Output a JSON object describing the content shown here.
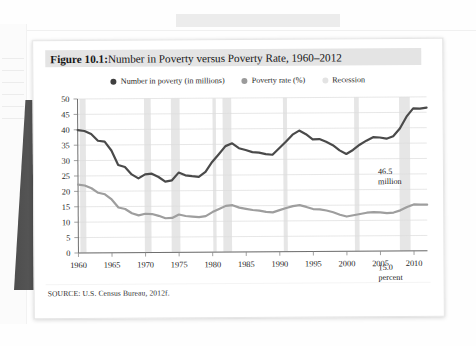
{
  "figure": {
    "label": "Figure 10.1:",
    "title": " Number in Poverty versus Poverty Rate, 1960–2012",
    "source": "SOURCE: U.S. Census Bureau, 2012f."
  },
  "legend": [
    {
      "name": "legend-number-in-poverty",
      "label": "Number in poverty (in millions)",
      "color": "#3f3f3f"
    },
    {
      "name": "legend-poverty-rate",
      "label": "Poverty rate (%)",
      "color": "#9b9b9b"
    },
    {
      "name": "legend-recession",
      "label": "Recession",
      "color": "#e3e3e3"
    }
  ],
  "annotations": [
    {
      "name": "annotation-number",
      "line1": "46.5",
      "line2": "million"
    },
    {
      "name": "annotation-rate",
      "line1": "15.0",
      "line2": "percent"
    }
  ],
  "colors": {
    "number_line": "#4a4a4a",
    "rate_line": "#9e9e9e",
    "recession_band": "#e6e6e6",
    "grid": "#dcdcdc",
    "axis": "#8a8a8a",
    "title_highlight": "#e4e4e4",
    "card": "#ffffff",
    "spine": "#4e4e4e"
  },
  "chart_data": {
    "type": "line",
    "title": "Figure 10.1: Number in Poverty versus Poverty Rate, 1960–2012",
    "xlabel": "",
    "ylabel": "",
    "xlim": [
      1960,
      2012
    ],
    "ylim": [
      0,
      50
    ],
    "ytick_step": 5,
    "yticks": [
      0,
      5,
      10,
      15,
      20,
      25,
      30,
      35,
      40,
      45,
      50
    ],
    "xticks": [
      1960,
      1965,
      1970,
      1975,
      1980,
      1985,
      1990,
      1995,
      2000,
      2005,
      2010
    ],
    "grid": true,
    "legend_position": "top-center",
    "x": [
      1960,
      1961,
      1962,
      1963,
      1964,
      1965,
      1966,
      1967,
      1968,
      1969,
      1970,
      1971,
      1972,
      1973,
      1974,
      1975,
      1976,
      1977,
      1978,
      1979,
      1980,
      1981,
      1982,
      1983,
      1984,
      1985,
      1986,
      1987,
      1988,
      1989,
      1990,
      1991,
      1992,
      1993,
      1994,
      1995,
      1996,
      1997,
      1998,
      1999,
      2000,
      2001,
      2002,
      2003,
      2004,
      2005,
      2006,
      2007,
      2008,
      2009,
      2010,
      2011,
      2012
    ],
    "series": [
      {
        "name": "Number in poverty (in millions)",
        "color": "#4a4a4a",
        "end_label": "46.5 million",
        "values": [
          39.9,
          39.6,
          38.6,
          36.4,
          36.1,
          33.2,
          28.5,
          27.8,
          25.4,
          24.1,
          25.4,
          25.6,
          24.5,
          23.0,
          23.4,
          25.9,
          25.0,
          24.7,
          24.5,
          26.1,
          29.3,
          31.8,
          34.4,
          35.3,
          33.7,
          33.1,
          32.4,
          32.2,
          31.7,
          31.5,
          33.6,
          35.7,
          38.0,
          39.3,
          38.1,
          36.4,
          36.5,
          35.6,
          34.5,
          32.8,
          31.6,
          32.9,
          34.6,
          35.9,
          37.0,
          36.9,
          36.5,
          37.3,
          39.8,
          43.6,
          46.3,
          46.2,
          46.5
        ]
      },
      {
        "name": "Poverty rate (%)",
        "color": "#9e9e9e",
        "end_label": "15.0 percent",
        "values": [
          22.2,
          21.9,
          21.0,
          19.5,
          19.0,
          17.3,
          14.7,
          14.2,
          12.8,
          12.1,
          12.6,
          12.5,
          11.9,
          11.1,
          11.2,
          12.3,
          11.8,
          11.6,
          11.4,
          11.7,
          13.0,
          14.0,
          15.0,
          15.2,
          14.4,
          14.0,
          13.6,
          13.4,
          13.0,
          12.8,
          13.5,
          14.2,
          14.8,
          15.1,
          14.5,
          13.8,
          13.7,
          13.3,
          12.7,
          11.9,
          11.3,
          11.7,
          12.1,
          12.5,
          12.7,
          12.6,
          12.3,
          12.5,
          13.2,
          14.3,
          15.1,
          15.0,
          15.0
        ]
      }
    ],
    "recessions": [
      {
        "start": 1960.3,
        "end": 1961.2
      },
      {
        "start": 1969.9,
        "end": 1970.9
      },
      {
        "start": 1973.9,
        "end": 1975.2
      },
      {
        "start": 1980.1,
        "end": 1980.6
      },
      {
        "start": 1981.6,
        "end": 1982.9
      },
      {
        "start": 1990.6,
        "end": 1991.2
      },
      {
        "start": 2001.2,
        "end": 2001.9
      },
      {
        "start": 2007.9,
        "end": 2009.5
      }
    ]
  }
}
